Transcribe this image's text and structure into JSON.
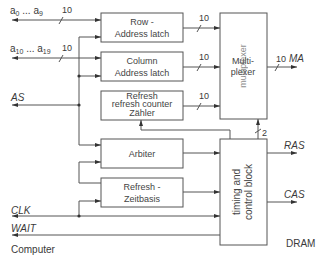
{
  "diagram": {
    "left_side_label": "Computer",
    "right_side_label": "DRAM",
    "inputs": {
      "addr_low": {
        "label_prefix": "a",
        "from_sub": "0",
        "ellipsis": " ... ",
        "to_sub": "9",
        "bus_width": "10"
      },
      "addr_high": {
        "label_prefix": "a",
        "from_sub": "10",
        "ellipsis": " ... ",
        "to_sub": "19",
        "bus_width": "10"
      },
      "as": "AS",
      "clk": "CLK",
      "wait": "WAIT"
    },
    "blocks": {
      "row_latch": {
        "line1": "Row -",
        "line2": "Address latch",
        "overlay1": "Row -",
        "overlay2": "Address latch"
      },
      "column_latch": {
        "line1": "Column",
        "line2": "Address latch",
        "overlay1": "Column",
        "overlay2": "address latch"
      },
      "refresh_counter": {
        "line1": "Refresh",
        "line2": "refresh counter",
        "line3": "Zähler"
      },
      "arbiter": {
        "line1": "Arbiter",
        "overlay1": "arbiter"
      },
      "refresh_timebase": {
        "line1": "Refresh -",
        "line2": "Zeitbasis",
        "overlay1": "Refresh -",
        "overlay2": "timebase"
      },
      "multiplexer": {
        "line1": "Multi-",
        "line2": "plexer",
        "vertical": "multiplexer"
      },
      "timing_control": {
        "line1": "timing and",
        "line2": "control block"
      }
    },
    "buses": {
      "row_to_mux": "10",
      "col_to_mux": "10",
      "refresh_to_mux": "10",
      "mux_out": "10",
      "control_to_mux": "2"
    },
    "outputs": {
      "ma": "MA",
      "ras": "RAS",
      "cas": "CAS"
    }
  }
}
